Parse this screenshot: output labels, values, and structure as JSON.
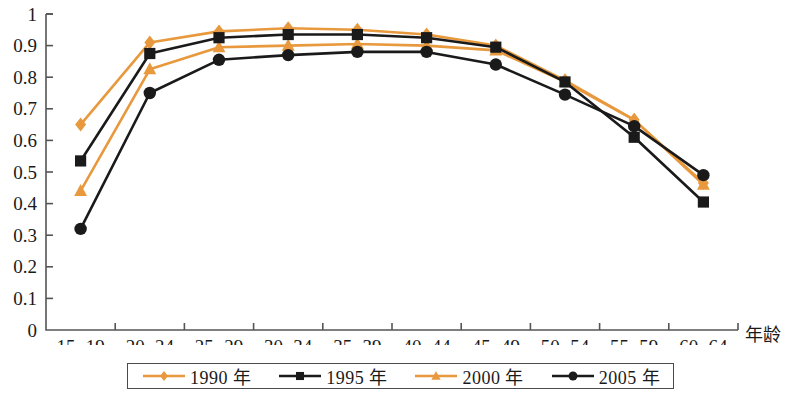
{
  "chart_data": {
    "type": "line",
    "title": "",
    "xlabel": "年龄",
    "ylabel": "",
    "ylim": [
      0,
      1
    ],
    "yticks": [
      "0",
      "0.1",
      "0.2",
      "0.3",
      "0.4",
      "0.5",
      "0.6",
      "0.7",
      "0.8",
      "0.9",
      "1"
    ],
    "grid": false,
    "legend_position": "bottom",
    "categories": [
      "15~19",
      "20~24",
      "25~29",
      "30~34",
      "35~39",
      "40~44",
      "45~49",
      "50~54",
      "55~59",
      "60~64"
    ],
    "series": [
      {
        "name": "1990 年",
        "marker": "diamond",
        "color": "#E8993D",
        "values": [
          0.65,
          0.91,
          0.945,
          0.955,
          0.95,
          0.935,
          0.9,
          0.79,
          0.665,
          0.465
        ]
      },
      {
        "name": "1995 年",
        "marker": "square",
        "color": "#1a1a1a",
        "values": [
          0.535,
          0.875,
          0.925,
          0.935,
          0.935,
          0.925,
          0.895,
          0.785,
          0.61,
          0.405
        ]
      },
      {
        "name": "2000 年",
        "marker": "triangle",
        "color": "#E8993D",
        "values": [
          0.44,
          0.825,
          0.895,
          0.9,
          0.905,
          0.9,
          0.885,
          0.785,
          0.665,
          0.46
        ]
      },
      {
        "name": "2005 年",
        "marker": "circle",
        "color": "#1a1a1a",
        "values": [
          0.32,
          0.75,
          0.855,
          0.87,
          0.88,
          0.88,
          0.84,
          0.745,
          0.645,
          0.49
        ]
      }
    ]
  },
  "axis": {
    "x_axis_title": "年龄"
  },
  "legend": {
    "items": [
      {
        "label": "1990 年",
        "marker": "diamond",
        "color": "#E8993D"
      },
      {
        "label": "1995 年",
        "marker": "square",
        "color": "#1a1a1a"
      },
      {
        "label": "2000 年",
        "marker": "triangle",
        "color": "#E8993D"
      },
      {
        "label": "2005 年",
        "marker": "circle",
        "color": "#1a1a1a"
      }
    ]
  }
}
